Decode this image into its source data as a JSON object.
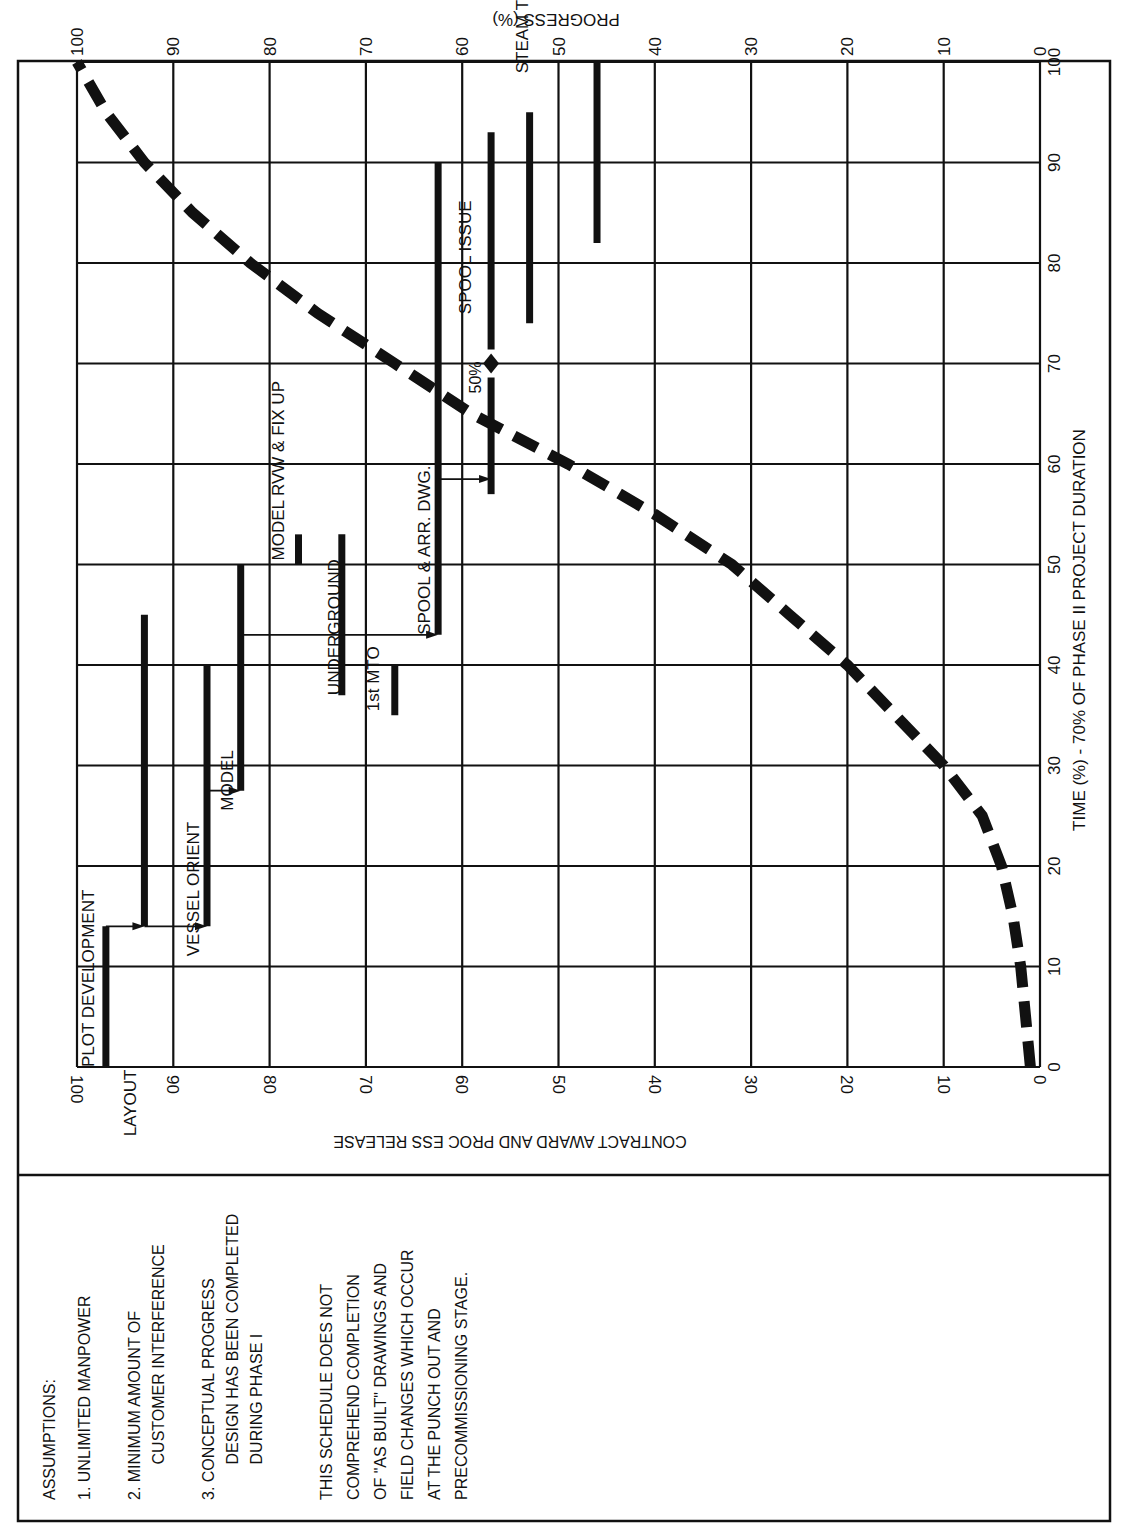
{
  "chart_data": {
    "type": "line",
    "xlabel": "TIME (%) - 70% OF PHASE II PROJECT DURATION",
    "ylabel": "PROGRESS (%)",
    "secondary_label": "CONTRACT AWARD AND PROC ESS RELEASE",
    "xlim": [
      0,
      100
    ],
    "ylim": [
      0,
      100
    ],
    "x_ticks": [
      "0",
      "10",
      "20",
      "30",
      "40",
      "50",
      "60",
      "70",
      "80",
      "90",
      "100"
    ],
    "y_ticks": [
      "100",
      "90",
      "80",
      "70",
      "60",
      "50",
      "40",
      "30",
      "20",
      "10",
      "0"
    ],
    "grid": true,
    "orientation_note": "figure is rotated 90 degrees; time axis runs vertically, progress axis runs horizontally",
    "series": [
      {
        "name": "Planned progress (S-curve)",
        "style": "dashed",
        "x": [
          0,
          5,
          10,
          15,
          20,
          25,
          30,
          35,
          40,
          45,
          50,
          55,
          60,
          65,
          70,
          75,
          80,
          85,
          90,
          95,
          100
        ],
        "values": [
          1,
          1.5,
          2,
          2.8,
          4,
          6,
          10,
          15,
          20,
          26,
          32,
          40,
          49,
          59,
          67,
          75,
          82,
          88,
          93,
          97,
          100
        ]
      }
    ],
    "tasks": [
      {
        "label": "PLOT DEVELOPMENT",
        "progress": 97,
        "start": 0,
        "end": 14
      },
      {
        "label": "LAYOUT",
        "progress": 93,
        "start": 14,
        "end": 45
      },
      {
        "label": "VESSEL ORIENT",
        "progress": 86.5,
        "start": 14,
        "end": 40
      },
      {
        "label": "MODEL",
        "progress": 83,
        "start": 27.5,
        "end": 50
      },
      {
        "label": "MODEL RVW & FIX UP",
        "progress": 77,
        "start": 50,
        "end": 53
      },
      {
        "label": "UNDERGROUND",
        "progress": 72.5,
        "start": 37,
        "end": 53
      },
      {
        "label": "1st MTO",
        "progress": 67,
        "start": 35,
        "end": 40
      },
      {
        "label": "SPOOL & ARR. DWG.",
        "progress": 62.5,
        "start": 43,
        "end": 90
      },
      {
        "label": "SPOOL ISSUE",
        "progress": 57,
        "start": 57,
        "end": 93,
        "milestone": {
          "label": "50%",
          "at": 70
        }
      },
      {
        "label": "STEAM TRACE & HYDRO PACKAGES",
        "progress": 53,
        "start": 74,
        "end": 95
      },
      {
        "label": "JOB CLEAN UP OF ENGINEERING HOLDS",
        "progress": 46,
        "start": 82,
        "end": 100
      }
    ],
    "annotations": [
      "50%"
    ]
  },
  "notes": {
    "heading": "ASSUMPTIONS:",
    "items": [
      [
        "1. UNLIMITED MANPOWER"
      ],
      [
        "2. MINIMUM AMOUNT OF",
        "    CUSTOMER INTERFERENCE"
      ],
      [
        "3. CONCEPTUAL PROGRESS",
        "    DESIGN HAS BEEN COMPLETED",
        "    DURING PHASE I"
      ]
    ],
    "disclaimer": [
      "THIS SCHEDULE DOES NOT",
      "COMPREHEND COMPLETION",
      "OF \"AS BUILT\" DRAWINGS AND",
      "FIELD CHANGES WHICH OCCUR",
      "AT THE PUNCH OUT AND",
      "PRECOMMISSIONING STAGE."
    ]
  }
}
